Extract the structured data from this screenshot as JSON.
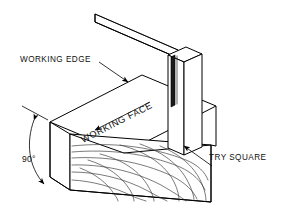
{
  "figure": {
    "background_color": "#ffffff",
    "line_color": "#000000",
    "width": 284,
    "height": 221
  },
  "labels": {
    "working_edge": "WORKING EDGE",
    "working_face": "WORKING FACE",
    "try_square": "TRY SQUARE",
    "angle": "90°"
  },
  "parts": {
    "timber_block": "timber-block",
    "try_square_blade": "try-square-blade",
    "try_square_stock": "try-square-stock",
    "wood_grain": "wood-grain"
  },
  "annotations": {
    "edge_leader": "leader-line-working-edge",
    "square_leader": "leader-line-try-square",
    "angle_arc": "angle-arc-90-degrees",
    "direction_arrow": "direction-arrow-along-edge"
  }
}
